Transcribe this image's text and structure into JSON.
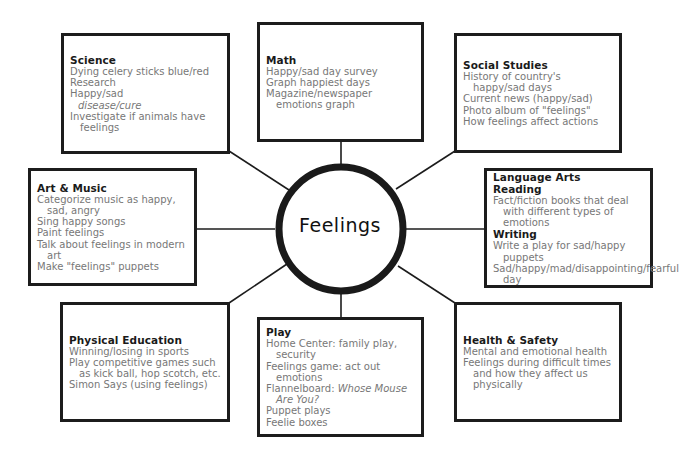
{
  "center": {
    "label": "Feelings"
  },
  "boxes": {
    "science": {
      "title": "Science",
      "items": [
        "Dying celery sticks blue/red",
        "Research",
        "Happy/sad",
        "disease/cure",
        "Investigate if animals have feelings"
      ]
    },
    "math": {
      "title": "Math",
      "items": [
        "Happy/sad day survey",
        "Graph happiest days",
        "Magazine/newspaper emotions graph"
      ]
    },
    "social_studies": {
      "title": "Social Studies",
      "items": [
        "History of country's happy/sad days",
        "Current news (happy/sad)",
        "Photo album of \"feelings\"",
        "How feelings affect actions"
      ]
    },
    "art_music": {
      "title": "Art & Music",
      "items": [
        "Categorize music as happy, sad, angry",
        "Sing happy songs",
        "Paint feelings",
        "Talk about feelings in modern art",
        "Make \"feelings\" puppets"
      ]
    },
    "language_arts": {
      "title": "Language Arts",
      "reading_label": "Reading",
      "reading_items": [
        "Fact/fiction books that deal with different types of emotions"
      ],
      "writing_label": "Writing",
      "writing_items": [
        "Write a play for sad/happy puppets",
        "Sad/happy/mad/disappointing/fearful day"
      ]
    },
    "physical_education": {
      "title": "Physical Education",
      "items": [
        "Winning/losing in sports",
        "Play competitive games such as kick ball, hop scotch, etc.",
        "Simon Says (using feelings)"
      ]
    },
    "play": {
      "title": "Play",
      "items": [
        "Home Center: family play, security",
        "Feelings game: act out emotions"
      ],
      "flannel_prefix": "Flannelboard: ",
      "flannel_title": "Whose Mouse Are You?",
      "items2": [
        "Puppet plays",
        "Feelie boxes"
      ]
    },
    "health_safety": {
      "title": "Health & Safety",
      "items": [
        "Mental and emotional health",
        "Feelings during difficult times and how they affect us physically"
      ]
    }
  }
}
